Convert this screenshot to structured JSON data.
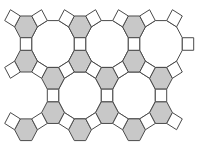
{
  "figure": {
    "title": "Truncated trihexagonal tiling (4.6.12)",
    "width": 207,
    "height": 152,
    "edge_length": 11.4,
    "scale_y": 1.1,
    "colors": {
      "background": "#ffffff",
      "hexagon_fill": "#c8c8c8",
      "square_fill": "#ffffff",
      "dodecagon_fill": "#ffffff",
      "stroke": "#4a4a4a"
    },
    "stroke_width": 1,
    "dodecagons": [
      {
        "x": 53,
        "y": 40
      },
      {
        "x": 107,
        "y": 40
      },
      {
        "x": 161,
        "y": 40
      },
      {
        "x": 80,
        "y": 86.77
      },
      {
        "x": 134,
        "y": 86.77
      }
    ],
    "hexagons": [
      {
        "x": 26,
        "y": 24.41
      },
      {
        "x": 80,
        "y": 24.41
      },
      {
        "x": 134,
        "y": 24.41
      },
      {
        "x": 26,
        "y": 55.59
      },
      {
        "x": 80,
        "y": 55.59
      },
      {
        "x": 134,
        "y": 55.59
      },
      {
        "x": 53,
        "y": 71.18
      },
      {
        "x": 107,
        "y": 71.18
      },
      {
        "x": 161,
        "y": 71.18
      },
      {
        "x": 53,
        "y": 102.36
      },
      {
        "x": 107,
        "y": 102.36
      },
      {
        "x": 161,
        "y": 102.36
      },
      {
        "x": 26,
        "y": 117.95
      },
      {
        "x": 80,
        "y": 117.95
      },
      {
        "x": 134,
        "y": 117.95
      }
    ],
    "squares": [
      {
        "x": 12.5,
        "y": 16.62,
        "angle": -60
      },
      {
        "x": 39.5,
        "y": 16.62,
        "angle": 60
      },
      {
        "x": 66.5,
        "y": 16.62,
        "angle": -60
      },
      {
        "x": 93.5,
        "y": 16.62,
        "angle": 60
      },
      {
        "x": 120.5,
        "y": 16.62,
        "angle": -60
      },
      {
        "x": 147.5,
        "y": 16.62,
        "angle": 60
      },
      {
        "x": 174.5,
        "y": 16.62,
        "angle": -60
      },
      {
        "x": 26,
        "y": 40,
        "angle": 0
      },
      {
        "x": 80,
        "y": 40,
        "angle": 0
      },
      {
        "x": 134,
        "y": 40,
        "angle": 0
      },
      {
        "x": 188,
        "y": 40,
        "angle": 0
      },
      {
        "x": 12.5,
        "y": 63.38,
        "angle": 60
      },
      {
        "x": 39.5,
        "y": 63.38,
        "angle": -60
      },
      {
        "x": 66.5,
        "y": 63.38,
        "angle": 60
      },
      {
        "x": 93.5,
        "y": 63.38,
        "angle": -60
      },
      {
        "x": 120.5,
        "y": 63.38,
        "angle": 60
      },
      {
        "x": 147.5,
        "y": 63.38,
        "angle": -60
      },
      {
        "x": 174.5,
        "y": 63.38,
        "angle": 60
      },
      {
        "x": 53,
        "y": 86.77,
        "angle": 0
      },
      {
        "x": 107,
        "y": 86.77,
        "angle": 0
      },
      {
        "x": 161,
        "y": 86.77,
        "angle": 0
      },
      {
        "x": 12.5,
        "y": 110.15,
        "angle": -60
      },
      {
        "x": 39.5,
        "y": 110.15,
        "angle": 60
      },
      {
        "x": 66.5,
        "y": 110.15,
        "angle": -60
      },
      {
        "x": 93.5,
        "y": 110.15,
        "angle": 60
      },
      {
        "x": 120.5,
        "y": 110.15,
        "angle": -60
      },
      {
        "x": 147.5,
        "y": 110.15,
        "angle": 60
      },
      {
        "x": 174.5,
        "y": 110.15,
        "angle": -60
      }
    ]
  }
}
